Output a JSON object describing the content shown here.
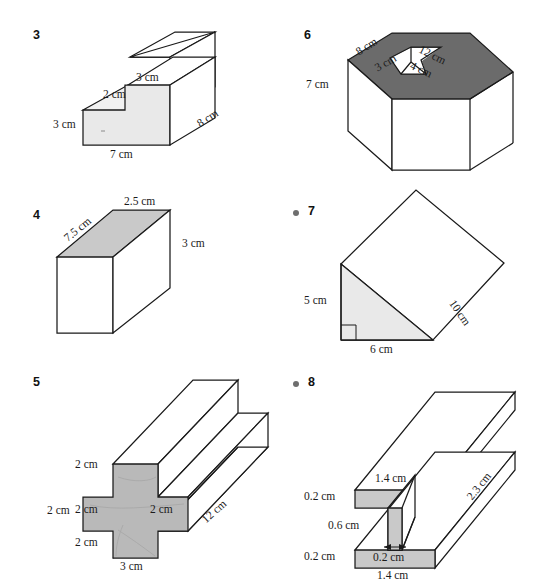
{
  "page": {
    "background": "#ffffff",
    "width": 557,
    "height": 579
  },
  "colors": {
    "ink": "#1a1a1a",
    "light_face": "#e9e9e9",
    "mid_face": "#c9c9c9",
    "gray_face": "#b9b9b9",
    "dark_face": "#6b6b6b",
    "bullet": "#6e6e6e"
  },
  "figures": [
    {
      "id": "fig3",
      "number": "3",
      "bullet": false,
      "shape": "l-shaped-step-prism",
      "labels": [
        {
          "name": "depth-3cm",
          "text": "3 cm"
        },
        {
          "name": "step-2cm",
          "text": "2 cm"
        },
        {
          "name": "height-3cm",
          "text": "3 cm"
        },
        {
          "name": "width-7cm",
          "text": "7 cm"
        },
        {
          "name": "length-8cm",
          "text": "8 cm"
        }
      ]
    },
    {
      "id": "fig6",
      "number": "6",
      "bullet": false,
      "shape": "rectangular-prism-with-square-hole",
      "labels": [
        {
          "name": "top-left-8cm",
          "text": "8 cm"
        },
        {
          "name": "top-right-12cm",
          "text": "12 cm"
        },
        {
          "name": "hole-3cm",
          "text": "3 cm"
        },
        {
          "name": "hole-4cm",
          "text": "4 cm"
        },
        {
          "name": "height-7cm",
          "text": "7 cm"
        }
      ]
    },
    {
      "id": "fig4",
      "number": "4",
      "bullet": false,
      "shape": "rectangular-prism",
      "labels": [
        {
          "name": "top-2-5cm",
          "text": "2.5 cm"
        },
        {
          "name": "slant-7-5cm",
          "text": "7.5 cm"
        },
        {
          "name": "height-3cm",
          "text": "3 cm"
        }
      ]
    },
    {
      "id": "fig7",
      "number": "7",
      "bullet": true,
      "shape": "triangular-prism",
      "labels": [
        {
          "name": "height-5cm",
          "text": "5 cm"
        },
        {
          "name": "base-6cm",
          "text": "6 cm"
        },
        {
          "name": "length-10cm",
          "text": "10 cm"
        }
      ]
    },
    {
      "id": "fig5",
      "number": "5",
      "bullet": false,
      "shape": "cross-section-prism",
      "labels": [
        {
          "name": "top-arm-2cm",
          "text": "2 cm"
        },
        {
          "name": "left-arm-2cm",
          "text": "2 cm"
        },
        {
          "name": "center-left-2cm",
          "text": "2 cm"
        },
        {
          "name": "center-right-2cm",
          "text": "2 cm"
        },
        {
          "name": "bottom-arm-2cm",
          "text": "2 cm"
        },
        {
          "name": "width-3cm",
          "text": "3 cm"
        },
        {
          "name": "length-12cm",
          "text": "12 cm"
        }
      ]
    },
    {
      "id": "fig8",
      "number": "8",
      "bullet": true,
      "shape": "i-beam-prism",
      "labels": [
        {
          "name": "top-flange-thickness",
          "text": "0.2 cm"
        },
        {
          "name": "top-flange-width",
          "text": "1.4 cm"
        },
        {
          "name": "web-height",
          "text": "0.6 cm"
        },
        {
          "name": "web-thickness",
          "text": "0.2 cm"
        },
        {
          "name": "bottom-flange-thickness",
          "text": "0.2 cm"
        },
        {
          "name": "bottom-flange-width",
          "text": "1.4 cm"
        },
        {
          "name": "length-2-3cm",
          "text": "2.3 cm"
        }
      ]
    }
  ]
}
